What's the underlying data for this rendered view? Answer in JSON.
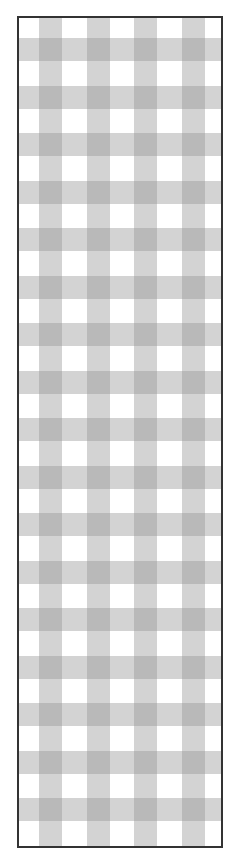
{
  "image": {
    "description": "Gingham (checkered) gray and white pattern inside a thin dark border",
    "pattern": {
      "type": "gingham",
      "stripe_color": "#9a9a9a",
      "stripe_opacity": 0.42,
      "light_cell": "#d2d2d2",
      "dark_cell": "#b2b2b2",
      "background": "#ffffff",
      "stripe_width": 23,
      "period": 47.5,
      "offset_x": 20,
      "offset_y": 20
    },
    "frame": {
      "border_color": "#333333",
      "border_width": 2
    }
  }
}
